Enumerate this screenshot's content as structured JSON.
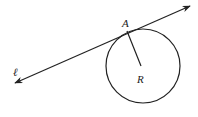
{
  "diagram": {
    "type": "geometry",
    "line": {
      "label": "ℓ",
      "start": [
        15,
        83
      ],
      "end": [
        190,
        6
      ],
      "arrows": "both",
      "color": "#222222"
    },
    "circle": {
      "center": [
        143,
        66
      ],
      "radius": 37,
      "color": "#222222"
    },
    "tangent_point": {
      "label": "A",
      "position": [
        127,
        31
      ]
    },
    "center_point": {
      "label": "R",
      "position": [
        141,
        66
      ]
    },
    "radius_segment": {
      "from": "A",
      "to": "R"
    }
  }
}
